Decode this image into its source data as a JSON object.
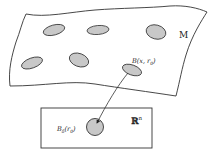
{
  "diagram": {
    "manifold_label": "M",
    "euclidean_label": "ℝ",
    "euclidean_exponent": "n",
    "ball_manifold_label": "B(x, r",
    "ball_manifold_sub": "0",
    "ball_manifold_close": ")",
    "ball_euclid_label": "B",
    "ball_euclid_sub": "δ",
    "ball_euclid_arg": "(r",
    "ball_euclid_arg_sub": "0",
    "ball_euclid_close": ")",
    "colors": {
      "stroke": "#333333",
      "fill_patch": "#c8c8c8",
      "background": "#ffffff"
    }
  }
}
